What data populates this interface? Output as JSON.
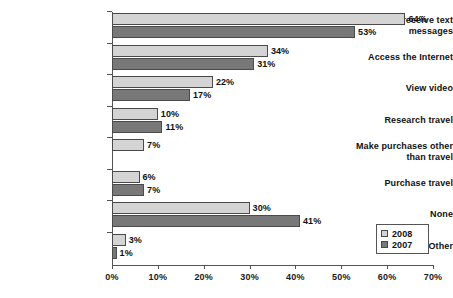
{
  "chart_data": {
    "type": "bar",
    "orientation": "horizontal",
    "title": "",
    "subtitle": "",
    "xlabel": "",
    "ylabel": "",
    "xlim": [
      0,
      70
    ],
    "xticks": [
      "0%",
      "10%",
      "20%",
      "30%",
      "40%",
      "50%",
      "60%",
      "70%"
    ],
    "xtick_values": [
      0,
      10,
      20,
      30,
      40,
      50,
      60,
      70
    ],
    "grid": false,
    "legend_position": "bottom-right",
    "categories": [
      "Send/receive text messages",
      "Access the Internet",
      "View video",
      "Research travel",
      "Make purchases other than travel",
      "Purchase travel",
      "None",
      "Other"
    ],
    "category_lines": [
      [
        "Send/receive text",
        "messages"
      ],
      [
        "Access the Internet"
      ],
      [
        "View video"
      ],
      [
        "Research travel"
      ],
      [
        "Make purchases other",
        "than travel"
      ],
      [
        "Purchase travel"
      ],
      [
        "None"
      ],
      [
        "Other"
      ]
    ],
    "series": [
      {
        "name": "2008",
        "color": "#d4d4d4",
        "values": [
          64,
          34,
          22,
          10,
          7,
          6,
          30,
          3
        ],
        "labels": [
          "64%",
          "34%",
          "22%",
          "10%",
          "7%",
          "6%",
          "30%",
          "3%"
        ]
      },
      {
        "name": "2007",
        "color": "#787878",
        "values": [
          53,
          31,
          17,
          11,
          null,
          7,
          41,
          1
        ],
        "labels": [
          "53%",
          "31%",
          "17%",
          "11%",
          "",
          "7%",
          "41%",
          "1%"
        ]
      }
    ]
  },
  "legend": {
    "entries": [
      {
        "label": "2008",
        "color": "#d4d4d4"
      },
      {
        "label": "2007",
        "color": "#787878"
      }
    ]
  }
}
